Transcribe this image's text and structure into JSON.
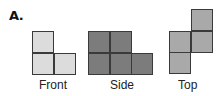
{
  "figure_label": "A.",
  "views": [
    {
      "name": "Front",
      "color": "#dcdcdc",
      "cells": [
        [
          0,
          0
        ],
        [
          0,
          1
        ],
        [
          1,
          1
        ]
      ]
    },
    {
      "name": "Side",
      "color": "#7c7c7c",
      "cells": [
        [
          0,
          0
        ],
        [
          1,
          0
        ],
        [
          0,
          1
        ],
        [
          1,
          1
        ],
        [
          2,
          1
        ]
      ]
    },
    {
      "name": "Top",
      "color": "#a9a9a9",
      "cells": [
        [
          1,
          0
        ],
        [
          0,
          1
        ],
        [
          1,
          1
        ],
        [
          0,
          2
        ]
      ]
    }
  ]
}
